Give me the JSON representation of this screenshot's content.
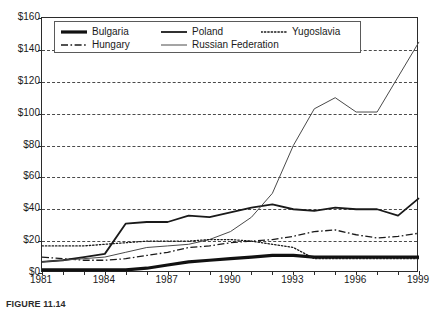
{
  "chart_data": {
    "type": "line",
    "title": "",
    "subtitle": "",
    "xlabel": "",
    "ylabel": "",
    "x": [
      1981,
      1982,
      1983,
      1984,
      1985,
      1986,
      1987,
      1988,
      1989,
      1990,
      1991,
      1992,
      1993,
      1994,
      1995,
      1996,
      1997,
      1998,
      1999
    ],
    "xlim": [
      1981,
      1999
    ],
    "ylim": [
      0,
      160
    ],
    "ytick_values": [
      0,
      20,
      40,
      60,
      80,
      100,
      120,
      140,
      160
    ],
    "ytick_labels": [
      "$0",
      "$20",
      "$40",
      "$60",
      "$80",
      "$100",
      "$120",
      "$140",
      "$160"
    ],
    "xtick_values": [
      1981,
      1982,
      1983,
      1984,
      1985,
      1986,
      1987,
      1988,
      1989,
      1990,
      1991,
      1992,
      1993,
      1994,
      1995,
      1996,
      1997,
      1998,
      1999
    ],
    "xtick_labels_shown": [
      "1981",
      "1984",
      "1987",
      "1990",
      "1993",
      "1996",
      "1999"
    ],
    "xtick_labels_shown_values": [
      1981,
      1984,
      1987,
      1990,
      1993,
      1996,
      1999
    ],
    "grid": true,
    "grid_axis": "y",
    "grid_style": "dashed",
    "legend_position": "top-inside",
    "legend_columns": 3,
    "series": [
      {
        "name": "Bulgaria",
        "style": "solid",
        "width": 3.2,
        "color": "#111111",
        "values": [
          2,
          2,
          2,
          2,
          2,
          3,
          5,
          7,
          8,
          9,
          10,
          11,
          11,
          10,
          10,
          10,
          10,
          10,
          10
        ]
      },
      {
        "name": "Poland",
        "style": "solid",
        "width": 1.8,
        "color": "#1a1a1a",
        "values": [
          7,
          8,
          10,
          12,
          31,
          32,
          32,
          36,
          35,
          38,
          41,
          43,
          40,
          39,
          41,
          40,
          40,
          36,
          47
        ]
      },
      {
        "name": "Hungary",
        "style": "dashdot",
        "width": 1.3,
        "color": "#1a1a1a",
        "values": [
          10,
          9,
          8,
          8,
          9,
          11,
          13,
          16,
          17,
          19,
          20,
          21,
          23,
          26,
          27,
          24,
          22,
          23,
          25
        ]
      },
      {
        "name": "Russian Federation",
        "style": "solid",
        "width": 1.0,
        "color": "#4a4a4a",
        "values": [
          7,
          8,
          9,
          10,
          13,
          16,
          17,
          18,
          21,
          26,
          35,
          50,
          80,
          103,
          110,
          101,
          101,
          123,
          145
        ]
      },
      {
        "name": "Yugoslavia",
        "style": "dotted",
        "width": 1.3,
        "color": "#1a1a1a",
        "values": [
          17,
          17,
          17,
          18,
          19,
          20,
          20,
          20,
          21,
          21,
          20,
          18,
          16,
          9,
          9,
          9,
          9,
          9,
          9
        ]
      }
    ]
  },
  "legend": {
    "entries": [
      {
        "label": "Bulgaria",
        "swatch": "thick-solid-line-icon"
      },
      {
        "label": "Poland",
        "swatch": "medium-solid-line-icon"
      },
      {
        "label": "Yugoslavia",
        "swatch": "dotted-line-icon"
      },
      {
        "label": "Hungary",
        "swatch": "dash-dot-line-icon"
      },
      {
        "label": "Russian Federation",
        "swatch": "thin-solid-line-icon"
      }
    ]
  },
  "caption": {
    "label": "FIGURE 11.14",
    "text": ""
  }
}
